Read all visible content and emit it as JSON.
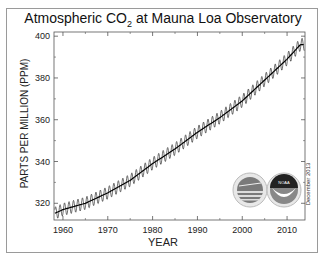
{
  "chart_data": {
    "type": "line",
    "title": "Atmospheric CO2 at Mauna Loa Observatory",
    "title_main": "Atmospheric CO",
    "title_sub": "2",
    "title_rest": " at Mauna Loa Observatory",
    "xlabel": "YEAR",
    "ylabel": "PARTS PER MILLION  (PPM)",
    "xlim": [
      1958,
      2014
    ],
    "ylim": [
      312,
      402
    ],
    "x_ticks": [
      1960,
      1970,
      1980,
      1990,
      2000,
      2010
    ],
    "y_ticks": [
      320,
      340,
      360,
      380,
      400
    ],
    "grid": false,
    "legend": "none",
    "annotation": "December 2013",
    "logos": [
      "scripps-logo",
      "noaa-logo"
    ],
    "series": [
      {
        "name": "Monthly mean (seasonal cycle)",
        "color": "#333333",
        "x": [
          1958,
          1960,
          1965,
          1970,
          1975,
          1980,
          1985,
          1990,
          1995,
          2000,
          2005,
          2010,
          2013
        ],
        "values": [
          315,
          317,
          320,
          325,
          331,
          339,
          346,
          354,
          361,
          369,
          379,
          389,
          396
        ]
      },
      {
        "name": "Annual trend",
        "color": "#000000",
        "x": [
          1958,
          1960,
          1965,
          1970,
          1975,
          1980,
          1985,
          1990,
          1995,
          2000,
          2005,
          2010,
          2013
        ],
        "values": [
          315,
          317,
          320,
          325,
          331,
          339,
          346,
          354,
          361,
          369,
          379,
          389,
          396
        ]
      }
    ],
    "seasonal_amplitude_ppm": 6
  }
}
